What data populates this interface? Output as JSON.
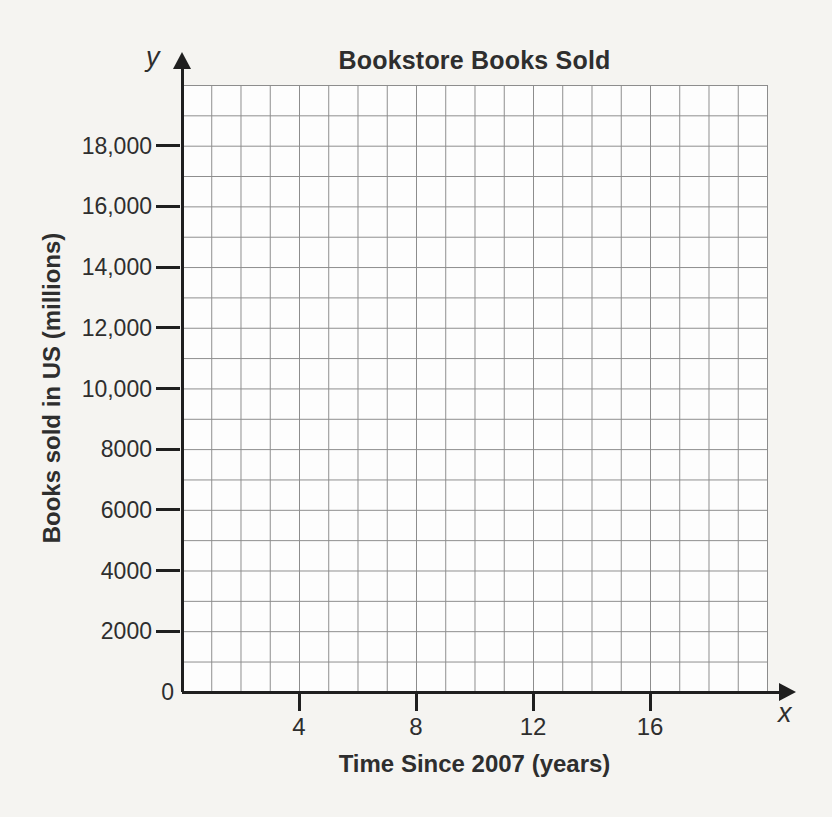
{
  "colors": {
    "page_bg": "#f5f4f1",
    "plot_bg": "#fdfdfd",
    "grid": "#8c8c8c",
    "axis": "#1f1f1f",
    "text": "#2e2e2e"
  },
  "chart_data": {
    "type": "line",
    "title": "Bookstore Books Sold",
    "xlabel": "Time Since 2007 (years)",
    "ylabel": "Books sold in US (millions)",
    "x_axis_letter": "x",
    "y_axis_letter": "y",
    "xlim": [
      0,
      20
    ],
    "ylim": [
      0,
      20000
    ],
    "x_gridline_step": 1,
    "y_gridline_step": 1000,
    "x_tick_values": [
      4,
      8,
      12,
      16
    ],
    "x_tick_labels": [
      "4",
      "8",
      "12",
      "16"
    ],
    "y_tick_values": [
      0,
      2000,
      4000,
      6000,
      8000,
      10000,
      12000,
      14000,
      16000,
      18000
    ],
    "y_tick_labels": [
      "0",
      "2000",
      "4000",
      "6000",
      "8000",
      "10,000",
      "12,000",
      "14,000",
      "16,000",
      "18,000"
    ],
    "grid": true,
    "legend": false,
    "series": []
  }
}
